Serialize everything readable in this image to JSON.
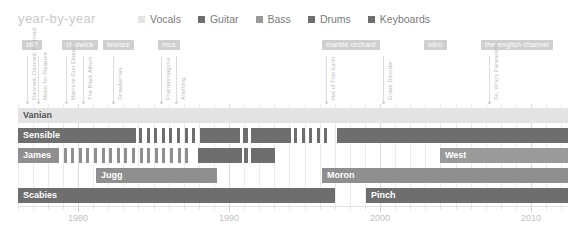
{
  "header": {
    "title": "year-by-year",
    "legend": [
      {
        "label": "Vocals",
        "color": "#e3e3e3"
      },
      {
        "label": "Guitar",
        "color": "#6e6e6e"
      },
      {
        "label": "Bass",
        "color": "#9a9a9a"
      },
      {
        "label": "Drums",
        "color": "#6e6e6e"
      },
      {
        "label": "Keyboards",
        "color": "#6e6e6e"
      }
    ]
  },
  "labels_color": "#cfcfcf",
  "record_labels": [
    {
      "name": "stiff",
      "x": 22
    },
    {
      "name": "chiswick",
      "x": 62
    },
    {
      "name": "bronze",
      "x": 103
    },
    {
      "name": "mca",
      "x": 158
    },
    {
      "name": "marble orchard",
      "x": 322
    },
    {
      "name": "nitro",
      "x": 424
    },
    {
      "name": "the english channel",
      "x": 481
    }
  ],
  "albums": [
    {
      "title": "Damned, Damned, Damned",
      "x": 27
    },
    {
      "title": "Music for Pleasure",
      "x": 38
    },
    {
      "title": "Machine Gun Etiquette",
      "x": 66
    },
    {
      "title": "The Black Album",
      "x": 83
    },
    {
      "title": "Strawberries",
      "x": 113
    },
    {
      "title": "Phantasmagoria",
      "x": 161
    },
    {
      "title": "Anything",
      "x": 176
    },
    {
      "title": "Not of This Earth",
      "x": 326
    },
    {
      "title": "Grave Disorder",
      "x": 383
    },
    {
      "title": "So, Who's Paranoid?",
      "x": 489
    }
  ],
  "chart_data": {
    "type": "timeline",
    "title": "year-by-year",
    "xlabel": "",
    "ylabel": "",
    "xlim": [
      1975,
      2012
    ],
    "axis_ticks_major": [
      1980,
      1990,
      2000,
      2010
    ],
    "tick_labels": [
      "1980",
      "1990",
      "2000",
      "2010"
    ],
    "grid": true,
    "legend_position": "top",
    "pixels_per_year": 15.1,
    "year_1980_x": 78,
    "members": [
      {
        "name": "Vanian",
        "role": "Vocals",
        "color": "#e3e3e3",
        "label_color": "#555555",
        "row_y": 4,
        "segments": [
          {
            "x": 18,
            "w": 550,
            "style": "solid"
          }
        ]
      },
      {
        "name": "Sensible",
        "role": "Guitar",
        "color": "#6e6e6e",
        "label_color": "#ffffff",
        "row_y": 24,
        "segments": [
          {
            "x": 18,
            "w": 118,
            "style": "solid"
          },
          {
            "x": 139,
            "w": 57,
            "style": "dashed"
          },
          {
            "x": 200,
            "w": 40,
            "style": "solid"
          },
          {
            "x": 243,
            "w": 5,
            "style": "solid"
          },
          {
            "x": 251,
            "w": 40,
            "style": "solid"
          },
          {
            "x": 294,
            "w": 39,
            "style": "dashed"
          },
          {
            "x": 337,
            "w": 231,
            "style": "solid"
          }
        ]
      },
      {
        "name": "James",
        "role": "Bass",
        "color": "#8f8f8f",
        "label_color": "#ffffff",
        "row_y": 44,
        "segments": [
          {
            "x": 18,
            "w": 37,
            "style": "solid"
          },
          {
            "x": 56,
            "w": 140,
            "style": "dashed"
          },
          {
            "x": 198,
            "w": 44,
            "style": "solid-dark"
          },
          {
            "x": 244,
            "w": 4,
            "style": "solid-dark"
          },
          {
            "x": 251,
            "w": 24,
            "style": "solid-dark"
          },
          {
            "x": 440,
            "w": 128,
            "style": "solid"
          }
        ]
      },
      {
        "name": "Jugg",
        "role": "Keyboards",
        "color": "#8f8f8f",
        "label_color": "#ffffff",
        "row_y": 64,
        "segments": [
          {
            "x": 96,
            "w": 121,
            "style": "solid"
          }
        ]
      },
      {
        "name": "Moron",
        "role": "Bass",
        "color": "#8f8f8f",
        "label_color": "#ffffff",
        "row_y": 64,
        "segments": [
          {
            "x": 322,
            "w": 246,
            "style": "solid"
          }
        ]
      },
      {
        "name": "West",
        "role": "Keyboards",
        "color": "#9a9a9a",
        "label_color": "#ffffff",
        "row_y": 44,
        "segments": [
          {
            "x": 440,
            "w": 128,
            "style": "solid"
          }
        ]
      },
      {
        "name": "Scabies",
        "role": "Drums",
        "color": "#6e6e6e",
        "label_color": "#ffffff",
        "row_y": 84,
        "segments": [
          {
            "x": 18,
            "w": 317,
            "style": "solid"
          }
        ]
      },
      {
        "name": "Pinch",
        "role": "Drums",
        "color": "#6e6e6e",
        "label_color": "#ffffff",
        "row_y": 84,
        "segments": [
          {
            "x": 366,
            "w": 202,
            "style": "solid"
          }
        ]
      }
    ]
  }
}
